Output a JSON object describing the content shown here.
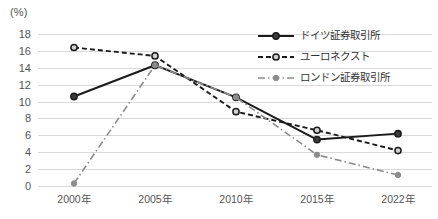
{
  "chart_data": {
    "type": "line",
    "title": "",
    "subtitle": "",
    "unit_label": "(%)",
    "xlabel": "",
    "ylabel": "",
    "categories": [
      "2000年",
      "2005年",
      "2010年",
      "2015年",
      "2022年"
    ],
    "x_values": [
      2000,
      2005,
      2010,
      2015,
      2022
    ],
    "ylim": [
      0,
      18
    ],
    "ytick_values": [
      0,
      2,
      4,
      6,
      8,
      10,
      12,
      14,
      16,
      18
    ],
    "ytick_labels": [
      "0",
      "2",
      "4",
      "6",
      "8",
      "10",
      "12",
      "14",
      "16",
      "18"
    ],
    "grid": "horizontal",
    "legend_position": "top-right",
    "series": [
      {
        "name": "ドイツ証券取引所",
        "values": [
          10.6,
          14.3,
          10.5,
          5.5,
          6.2
        ],
        "color": "#1a1a1a",
        "line_style": "solid",
        "marker": "filled-circle"
      },
      {
        "name": "ユーロネクスト",
        "values": [
          16.4,
          15.4,
          8.8,
          6.6,
          4.2
        ],
        "color": "#1a1a1a",
        "line_style": "dashed",
        "marker": "open-circle"
      },
      {
        "name": "ロンドン証券取引所",
        "values": [
          0.3,
          14.3,
          10.5,
          3.7,
          1.3
        ],
        "color": "#8c8c8c",
        "line_style": "dash-dot",
        "marker": "filled-circle-small"
      }
    ]
  },
  "colors": {
    "grid": "#d9d9d9",
    "text": "#555555",
    "series_dark": "#1a1a1a",
    "series_gray": "#8c8c8c",
    "background": "#ffffff"
  },
  "legend": {
    "items": [
      {
        "label": "ドイツ証券取引所"
      },
      {
        "label": "ユーロネクスト"
      },
      {
        "label": "ロンドン証券取引所"
      }
    ]
  }
}
